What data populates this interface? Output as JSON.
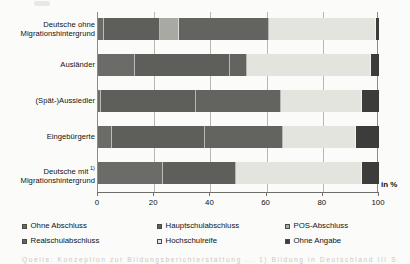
{
  "chart_data": {
    "type": "bar",
    "orientation": "horizontal",
    "stacked": true,
    "stacked_mode": "percent",
    "title": "",
    "subtitle": "",
    "xlabel": "in %",
    "ylabel": "",
    "xlim": [
      0,
      100
    ],
    "xticks": [
      0,
      20,
      40,
      60,
      80,
      100
    ],
    "xtick_labels": [
      "0",
      "20",
      "40",
      "60",
      "80",
      "100"
    ],
    "grid": true,
    "grid_axis": "x",
    "legend_position": "bottom",
    "categories": [
      "Deutsche ohne Migrationshintergrund",
      "Ausländer",
      "(Spät-)Aussiedler",
      "Eingebürgerte",
      "Deutsche mit Migrationshintergrund"
    ],
    "series": [
      {
        "name": "Ohne Abschluss",
        "color": "#6b6b68",
        "values": [
          2,
          13,
          1,
          5,
          23
        ]
      },
      {
        "name": "Hauptschulabschluss",
        "color": "#5e5e5b",
        "values": [
          20,
          34,
          34,
          33,
          26
        ]
      },
      {
        "name": "POS-Abschluss",
        "color": "#a9a9a4",
        "values": [
          7,
          0,
          0,
          0,
          0
        ]
      },
      {
        "name": "Realschulabschluss",
        "color": "#636360",
        "values": [
          32,
          6,
          30,
          28,
          0
        ]
      },
      {
        "name": "Hochschulreife",
        "color": "#e4e4df",
        "values": [
          38,
          44,
          29,
          26,
          45
        ]
      },
      {
        "name": "Ohne Angabe",
        "color": "#3c3c3a",
        "values": [
          1,
          3,
          6,
          8,
          6
        ]
      }
    ]
  },
  "axis": {
    "unit_label": "in %",
    "tick_labels": [
      "0",
      "20",
      "40",
      "60",
      "80",
      "100"
    ]
  },
  "categories": [
    {
      "line1": "Deutsche ohne",
      "line2": "Migrationshintergrund",
      "footnote": ""
    },
    {
      "line1": "Ausländer",
      "line2": "",
      "footnote": ""
    },
    {
      "line1": "(Spät-)Aussiedler",
      "line2": "",
      "footnote": ""
    },
    {
      "line1": "Eingebürgerte",
      "line2": "",
      "footnote": ""
    },
    {
      "line1": "Deutsche mit",
      "line2": "Migrationshintergrund",
      "footnote": "1)"
    }
  ],
  "legend": {
    "items": [
      {
        "label": "Ohne Abschluss",
        "color": "#6b6b68"
      },
      {
        "label": "Hauptschulabschluss",
        "color": "#5e5e5b"
      },
      {
        "label": "POS-Abschluss",
        "color": "#a9a9a4"
      },
      {
        "label": "Realschulabschluss",
        "color": "#636360"
      },
      {
        "label": "Hochschulreife",
        "color": "#e4e4df"
      },
      {
        "label": "Ohne Angabe",
        "color": "#3c3c3a"
      }
    ]
  },
  "footer": {
    "source_text": "Quelle: Konzeption zur Bildungsberichterstattung ... 1)  Bildung in Deutschland III S."
  }
}
